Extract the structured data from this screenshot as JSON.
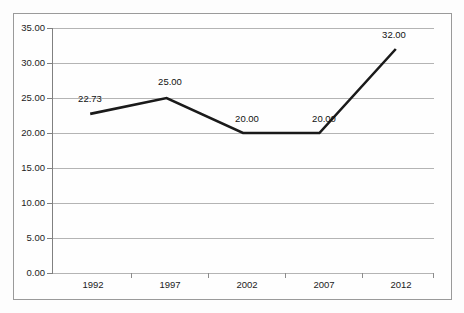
{
  "chart_data": {
    "type": "line",
    "title": "",
    "subtitle": "",
    "xlabel": "",
    "ylabel": "",
    "categories": [
      "1992",
      "1997",
      "2002",
      "2007",
      "2012"
    ],
    "values": [
      22.73,
      25.0,
      20.0,
      20.0,
      32.0
    ],
    "point_labels": [
      "22.73",
      "25.00",
      "20.00",
      "20.00",
      "32.00"
    ],
    "series": [
      {
        "name": "",
        "values": [
          22.73,
          25.0,
          20.0,
          20.0,
          32.0
        ]
      }
    ],
    "ylim": [
      0,
      35
    ],
    "ytick_step": 5,
    "ytick_labels": [
      "0.00",
      "5.00",
      "10.00",
      "15.00",
      "20.00",
      "25.00",
      "30.00",
      "35.00"
    ],
    "ytick_values": [
      0,
      5,
      10,
      15,
      20,
      25,
      30,
      35
    ],
    "xtick_labels": [
      "1992",
      "1997",
      "2002",
      "2007",
      "2012"
    ],
    "grid": true,
    "grid_axis": "y",
    "legend": false,
    "legend_position": "none",
    "markers": false,
    "annotations": []
  },
  "style": {
    "line_color": "#1a1a1a",
    "grid_color": "#b4b4b4",
    "axis_color": "#808080",
    "border_color": "#9a9a9a",
    "text_color": "#1c1c1c",
    "plot_background": "#fefefe",
    "page_background": "#fdfdfd"
  }
}
